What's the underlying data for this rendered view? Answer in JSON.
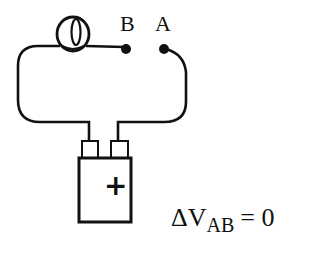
{
  "diagram": {
    "type": "circuit",
    "components": {
      "bulb": {
        "name": "light bulb"
      },
      "battery": {
        "name": "battery",
        "terminal_symbol": "+"
      },
      "point_b": {
        "label": "B"
      },
      "point_a": {
        "label": "A"
      }
    },
    "equation": {
      "delta": "Δ",
      "variable": "V",
      "subscript": "AB",
      "relation": "= 0"
    },
    "colors": {
      "ink": "#111111",
      "background": "#ffffff"
    }
  }
}
